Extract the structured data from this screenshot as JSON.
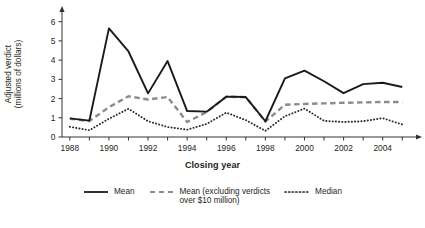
{
  "chart_data": {
    "type": "line",
    "title": "",
    "xlabel": "Closing year",
    "ylabel": "Adjusted verdict (millions of dollars)",
    "ylabel_line1": "Adjusted verdict",
    "ylabel_line2": "(millions of dollars)",
    "x": [
      1988,
      1989,
      1990,
      1991,
      1992,
      1993,
      1994,
      1995,
      1996,
      1997,
      1998,
      1999,
      2000,
      2001,
      2002,
      2003,
      2004,
      2005
    ],
    "xlim": [
      1987.6,
      2005.6
    ],
    "ylim": [
      0,
      6.4
    ],
    "xticks": [
      1988,
      1989,
      1990,
      1991,
      1992,
      1993,
      1994,
      1995,
      1996,
      1997,
      1998,
      1999,
      2000,
      2001,
      2002,
      2003,
      2004,
      2005
    ],
    "xtick_labels": [
      "1988",
      "",
      "1990",
      "",
      "1992",
      "",
      "1994",
      "",
      "1996",
      "",
      "1998",
      "",
      "2000",
      "",
      "2002",
      "",
      "2004",
      ""
    ],
    "yticks": [
      0,
      1,
      2,
      3,
      4,
      5,
      6
    ],
    "ytick_labels": [
      "0",
      "1",
      "2",
      "3",
      "4",
      "5",
      "6"
    ],
    "grid": false,
    "legend_position": "below",
    "series": [
      {
        "name": "Mean",
        "style": "solid",
        "color": "#1a1a1a",
        "values": [
          0.97,
          0.85,
          5.65,
          4.45,
          2.27,
          3.95,
          1.35,
          1.32,
          2.1,
          2.08,
          0.82,
          3.05,
          3.45,
          2.9,
          2.28,
          2.75,
          2.82,
          2.6
        ]
      },
      {
        "name": "Mean (excluding verdicts over $10 million)",
        "style": "dashed",
        "color": "#8c8c8c",
        "values": [
          0.95,
          0.83,
          1.55,
          2.12,
          1.95,
          2.08,
          0.78,
          1.3,
          2.1,
          2.07,
          0.8,
          1.68,
          1.72,
          1.75,
          1.78,
          1.8,
          1.82,
          1.82
        ]
      },
      {
        "name": "Median",
        "style": "dotted",
        "color": "#2a2a2a",
        "values": [
          0.53,
          0.35,
          0.95,
          1.47,
          0.82,
          0.52,
          0.38,
          0.68,
          1.27,
          0.88,
          0.32,
          1.08,
          1.48,
          0.84,
          0.78,
          0.82,
          0.98,
          0.65
        ]
      }
    ]
  },
  "legend": {
    "items": [
      {
        "label": "Mean",
        "style": "solid"
      },
      {
        "label": "Mean (excluding verdicts\nover $10 million)",
        "style": "dashed"
      },
      {
        "label": "Median",
        "style": "dotted"
      }
    ]
  },
  "colors": {
    "mean": "#1a1a1a",
    "mean_excluding": "#8c8c8c",
    "median": "#2a2a2a",
    "axis": "#333333",
    "background": "#ffffff"
  }
}
